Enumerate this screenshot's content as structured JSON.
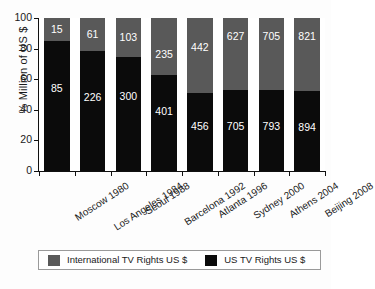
{
  "chart_data": {
    "type": "bar",
    "subtype": "stacked-100-percent",
    "title": "",
    "xlabel": "",
    "ylabel": "% Million of US $",
    "ylim": [
      0,
      100
    ],
    "yticks": [
      "0",
      "20",
      "40",
      "60",
      "80",
      "100"
    ],
    "grid": false,
    "categories": [
      "Moscow 1980",
      "Los Angeles 1984",
      "Seoul 1988",
      "Barcelona 1992",
      "Atlanta 1996",
      "Sydney 2000",
      "Athens 2004",
      "Beijing 2008"
    ],
    "series": [
      {
        "name": "International TV Rights US $",
        "color": "#595959",
        "values": [
          15,
          61,
          103,
          235,
          442,
          627,
          705,
          821
        ],
        "percent": [
          15.0,
          21.3,
          25.6,
          36.9,
          49.2,
          47.1,
          47.1,
          47.9
        ]
      },
      {
        "name": "US TV Rights US $",
        "color": "#0b0b0b",
        "values": [
          85,
          226,
          300,
          401,
          456,
          705,
          793,
          894
        ],
        "percent": [
          85.0,
          78.7,
          74.4,
          63.1,
          50.8,
          52.9,
          52.9,
          52.1
        ]
      }
    ],
    "legend_position": "bottom",
    "legend": [
      {
        "label": "International TV Rights US $",
        "color": "#595959",
        "swatch": "intl"
      },
      {
        "label": "US TV Rights US $",
        "color": "#0b0b0b",
        "swatch": "us"
      }
    ]
  }
}
